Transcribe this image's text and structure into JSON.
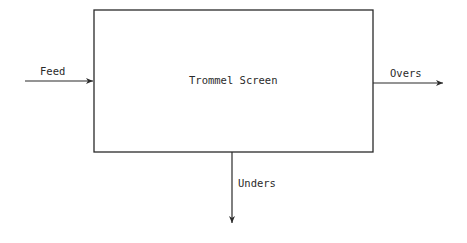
{
  "diagram": {
    "type": "process-block",
    "block": {
      "label": "Trommel Screen"
    },
    "streams": {
      "feed": {
        "label": "Feed",
        "direction": "in"
      },
      "overs": {
        "label": "Overs",
        "direction": "out"
      },
      "unders": {
        "label": "Unders",
        "direction": "out"
      }
    },
    "colors": {
      "line": "#2a2a2a",
      "background": "#ffffff"
    }
  }
}
